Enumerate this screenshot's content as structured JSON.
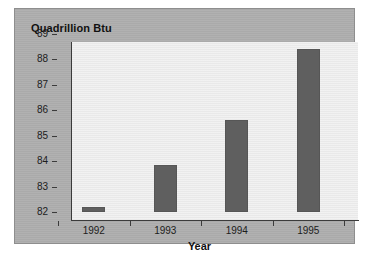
{
  "chart_data": {
    "type": "bar",
    "title": "Quadrillion Btu",
    "xlabel": "Year",
    "ylabel": "",
    "categories": [
      "1992",
      "1993",
      "1994",
      "1995"
    ],
    "values": [
      82.2,
      83.85,
      85.6,
      88.4
    ],
    "ylim": [
      82,
      89
    ],
    "yticks": [
      82,
      83,
      84,
      85,
      86,
      87,
      88,
      89
    ],
    "ytick_labels": [
      "82",
      "83",
      "84",
      "85",
      "86",
      "87",
      "88",
      "89"
    ],
    "grid": false,
    "legend": null,
    "bar_color": "#5f5f5f",
    "plot_background": "#ececec",
    "panel_background": "#adadad",
    "axis_color": "#3b3b3b",
    "text_color": "#111111"
  }
}
